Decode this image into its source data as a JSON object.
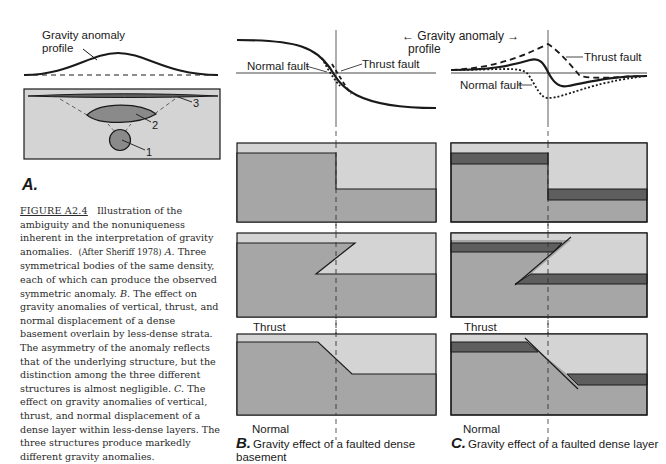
{
  "figure": {
    "id": "FIGURE A2.4",
    "caption_lead": "Illustration of the ambiguity and the nonuniqueness inherent in the interpretation of gravity anomalies.",
    "caption_source": "(After Sheriff 1978)",
    "caption_a_letter": "A.",
    "caption_a": "Three symmetrical bodies of the same density, each of which can produce the observed symmetric anomaly.",
    "caption_b_letter": "B.",
    "caption_b": "The effect on gravity anomalies of vertical, thrust, and normal displacement of a dense basement overlain by less-dense strata. The asymmetry of the anomaly reflects that of the underlying structure, but the distinction among the three different structures is almost negligible.",
    "caption_c_letter": "C.",
    "caption_c": "The effect on gravity anomalies of vertical, thrust, and normal displacement of a dense layer within less-dense layers. The three structures produce markedly different gravity anomalies."
  },
  "panel_a": {
    "letter": "A.",
    "profile_label_line1": "Gravity anomaly",
    "profile_label_line2": "profile",
    "bodies": [
      "1",
      "2",
      "3"
    ]
  },
  "shared_header": {
    "line1": "← Gravity anomaly →",
    "line2": "profile"
  },
  "panel_b": {
    "letter": "B.",
    "caption": "Gravity effect of a faulted dense basement",
    "graph_labels": {
      "normal": "Normal fault",
      "thrust": "Thrust fault"
    },
    "section_labels": {
      "thrust": "Thrust",
      "normal": "Normal"
    }
  },
  "panel_c": {
    "letter": "C.",
    "caption": "Gravity effect of a faulted dense layer",
    "graph_labels": {
      "normal": "Normal fault",
      "thrust": "Thrust fault"
    },
    "section_labels": {
      "thrust": "Thrust",
      "normal": "Normal"
    }
  },
  "colors": {
    "light_strata": "#d4d4d4",
    "dense": "#a6a6a6",
    "dense_layer": "#5e5e5e",
    "line": "#1a1a1a"
  }
}
